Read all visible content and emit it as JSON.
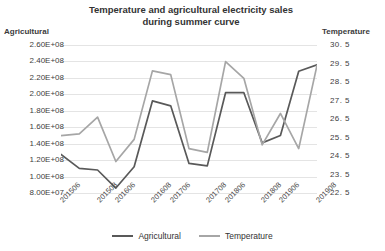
{
  "chart_data": {
    "type": "line",
    "title": "Temperature and agricultural electricity sales\nduring summer curve",
    "xlabel": "",
    "ylabel": "Agricultural",
    "y2label": "Temperature",
    "grid": true,
    "legend_position": "bottom",
    "categories": [
      "201506",
      "201507",
      "201508",
      "201606",
      "201607",
      "201608",
      "201706",
      "201707",
      "201708",
      "201806",
      "201807",
      "201808",
      "201906",
      "201907",
      "201908"
    ],
    "xtick_labels": [
      "201506",
      "201508",
      "201606",
      "201608",
      "201706",
      "201708",
      "201806",
      "201808",
      "201906",
      "201908"
    ],
    "ylim": [
      80000000,
      260000000
    ],
    "ytick_labels": [
      "2.60E+08",
      "2.40E+08",
      "2.20E+08",
      "2.00E+08",
      "1.80E+08",
      "1.60E+08",
      "1.40E+08",
      "1.20E+08",
      "1.00E+08",
      "8.00E+07"
    ],
    "ytick_values": [
      260000000,
      240000000,
      220000000,
      200000000,
      180000000,
      160000000,
      140000000,
      120000000,
      100000000,
      80000000
    ],
    "y2lim": [
      22.5,
      30.5
    ],
    "y2tick_labels": [
      "30. 5",
      "29. 5",
      "28. 5",
      "27. 5",
      "26. 5",
      "25. 5",
      "24. 5",
      "23. 5",
      "22. 5"
    ],
    "y2tick_values": [
      30.5,
      29.5,
      28.5,
      27.5,
      26.5,
      25.5,
      24.5,
      23.5,
      22.5
    ],
    "series": [
      {
        "name": "Agricultural",
        "axis": "left",
        "color": "#595959",
        "values": [
          127000000,
          110000000,
          108000000,
          86000000,
          112000000,
          192000000,
          186000000,
          116000000,
          113000000,
          202000000,
          202000000,
          141000000,
          150000000,
          228000000,
          236000000
        ]
      },
      {
        "name": "Temperature",
        "axis": "right",
        "color": "#a6a6a6",
        "values": [
          25.6,
          25.7,
          26.6,
          24.2,
          25.4,
          29.1,
          28.9,
          24.9,
          24.7,
          29.6,
          28.7,
          25.1,
          26.8,
          24.9,
          29.4
        ]
      }
    ],
    "legend": [
      {
        "label": "Agricultural",
        "color": "#595959"
      },
      {
        "label": "Temperature",
        "color": "#a6a6a6"
      }
    ]
  }
}
